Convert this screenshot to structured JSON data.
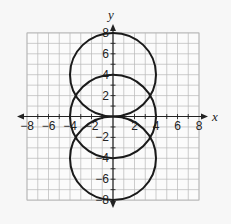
{
  "diagram": {
    "type": "coordinate-plane",
    "x_axis_label": "x",
    "y_axis_label": "y",
    "x_range": [
      -8,
      8
    ],
    "y_range": [
      -8,
      8
    ],
    "grid_step": 1,
    "x_tick_labels": [
      "−8",
      "−6",
      "−4",
      "−2",
      "2",
      "4",
      "6",
      "8"
    ],
    "x_tick_values": [
      -8,
      -6,
      -4,
      -2,
      2,
      4,
      6,
      8
    ],
    "y_tick_labels": [
      "8",
      "6",
      "4",
      "2",
      "−2",
      "−4",
      "−6",
      "−8"
    ],
    "y_tick_values": [
      8,
      6,
      4,
      2,
      -2,
      -4,
      -6,
      -8
    ],
    "circles": [
      {
        "center": [
          0,
          4
        ],
        "radius": 4
      },
      {
        "center": [
          0,
          0
        ],
        "radius": 4
      },
      {
        "center": [
          0,
          -4
        ],
        "radius": 4
      }
    ],
    "colors": {
      "grid": "#b8b8b8",
      "axis": "#222222",
      "curve": "#1a1a1a",
      "background": "#f7f7f7"
    }
  }
}
